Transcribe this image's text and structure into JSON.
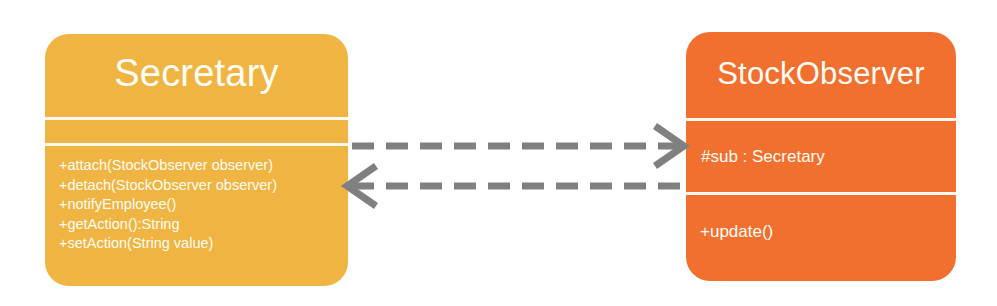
{
  "diagram": {
    "background_color": "#ffffff",
    "classes": [
      {
        "id": "secretary",
        "name": "Secretary",
        "fill_color": "#f0b442",
        "text_color": "#fffdf4",
        "attributes": [],
        "methods": [
          "+attach(StockObserver observer)",
          "+detach(StockObserver observer)",
          "+notifyEmployee()",
          "+getAction():String",
          "+setAction(String value)"
        ]
      },
      {
        "id": "observer",
        "name": "StockObserver",
        "fill_color": "#f1702f",
        "text_color": "#fffdf4",
        "attributes": [
          "#sub : Secretary"
        ],
        "methods": [
          "+update()"
        ]
      }
    ],
    "relationships": [
      {
        "id": "secretary-to-observer",
        "type": "dependency",
        "style": "dashed",
        "source": "Secretary",
        "target": "StockObserver",
        "direction": "right",
        "color": "#808080",
        "label": ""
      },
      {
        "id": "observer-to-secretary",
        "type": "dependency",
        "style": "dashed",
        "source": "StockObserver",
        "target": "Secretary",
        "direction": "left",
        "color": "#808080",
        "label": ""
      }
    ]
  }
}
